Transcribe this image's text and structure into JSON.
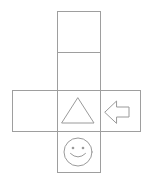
{
  "diagram": {
    "line_color": "#9e9e9e",
    "background_color": "#ffffff",
    "width": 150,
    "height": 181,
    "column": {
      "x": 57,
      "right": 100,
      "top": 11,
      "bottom": 172
    },
    "band": {
      "x": 12,
      "right": 140,
      "top": 90,
      "bottom": 131
    },
    "dividers": {
      "column_divider_y": 52
    },
    "faces": [
      {
        "id": "face-top",
        "name": "top-face",
        "symbol": "none",
        "symbol_label": "",
        "x": 57,
        "y": 11,
        "width": 43,
        "height": 41
      },
      {
        "id": "face-upper-middle",
        "name": "upper-middle-face",
        "symbol": "none",
        "symbol_label": "",
        "x": 57,
        "y": 52,
        "width": 43,
        "height": 38
      },
      {
        "id": "face-left",
        "name": "left-face",
        "symbol": "none",
        "symbol_label": "",
        "x": 12,
        "y": 90,
        "width": 45,
        "height": 41
      },
      {
        "id": "face-center",
        "name": "center-face",
        "symbol": "triangle",
        "symbol_label": "triangle",
        "x": 57,
        "y": 90,
        "width": 43,
        "height": 41
      },
      {
        "id": "face-right",
        "name": "right-face",
        "symbol": "left-arrow",
        "symbol_label": "left arrow",
        "x": 100,
        "y": 90,
        "width": 40,
        "height": 41
      },
      {
        "id": "face-bottom",
        "name": "bottom-face",
        "symbol": "smiley",
        "symbol_label": "smiley face",
        "x": 57,
        "y": 131,
        "width": 43,
        "height": 41
      }
    ],
    "symbols": {
      "triangle": {
        "name": "triangle-glyph",
        "apex_x": 78,
        "apex_y": 98,
        "left_x": 62,
        "right_x": 94,
        "base_y": 123
      },
      "arrow": {
        "name": "left-arrow-glyph",
        "tip_x": 105,
        "tail_x": 129,
        "center_y": 112,
        "head_half_height": 11,
        "shaft_half_height": 5
      },
      "smiley": {
        "name": "smiley-glyph",
        "center_x": 78,
        "center_y": 152,
        "radius": 14,
        "eye_offset_x": 5,
        "eye_offset_y": 4,
        "eye_radius": 1.3,
        "mouth_width": 15,
        "mouth_depth": 7
      }
    }
  }
}
